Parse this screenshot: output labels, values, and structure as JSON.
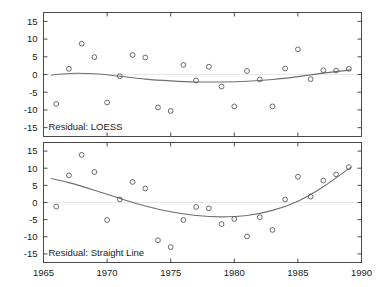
{
  "figure": {
    "background": "#ffffff",
    "axis_color": "#4a4a4a",
    "point_color": "#5a5a5a",
    "line_color": "#6f6f6f",
    "zero_line_color": "#e8e8e8",
    "width": 384,
    "height": 287
  },
  "chart_data": [
    {
      "type": "scatter",
      "panel": "top",
      "title": "",
      "annotation": "Residual: LOESS",
      "xlabel": "",
      "ylabel": "",
      "xlim": [
        1965,
        1990
      ],
      "ylim": [
        -17.5,
        17.5
      ],
      "xticks": [
        1965,
        1970,
        1975,
        1980,
        1985,
        1990
      ],
      "xticklabels": [
        "1965",
        "1970",
        "1975",
        "1980",
        "1985",
        "1990"
      ],
      "yticks": [
        -15,
        -10,
        -5,
        0,
        5,
        10,
        15
      ],
      "yticklabels": [
        "-15",
        "-10",
        "-5",
        "0",
        "5",
        "10",
        "15"
      ],
      "grid": false,
      "legend": "none",
      "zero_reference_line": 0,
      "series": [
        {
          "name": "Residual: LOESS",
          "marker": "open-circle",
          "x": [
            1966,
            1967,
            1968,
            1969,
            1970,
            1971,
            1972,
            1973,
            1974,
            1975,
            1976,
            1977,
            1978,
            1979,
            1980,
            1981,
            1982,
            1983,
            1984,
            1985,
            1986,
            1987,
            1988,
            1989
          ],
          "y": [
            -8.3,
            1.6,
            8.7,
            4.9,
            -7.9,
            -0.5,
            5.5,
            4.8,
            -9.3,
            -10.3,
            2.7,
            -1.7,
            2.2,
            -3.4,
            -9.0,
            1.0,
            -1.4,
            -9.0,
            1.7,
            7.1,
            -1.3,
            1.2,
            1.1,
            1.6
          ]
        },
        {
          "name": "LOESS smooth",
          "type": "line",
          "x": [
            1965.6,
            1967,
            1969,
            1971,
            1973,
            1975,
            1977,
            1979,
            1981,
            1983,
            1985,
            1987,
            1989.2
          ],
          "y": [
            -0.2,
            0.3,
            0.2,
            -0.5,
            -1.3,
            -1.8,
            -2.1,
            -2.1,
            -1.9,
            -1.4,
            -0.6,
            0.4,
            1.3
          ]
        }
      ]
    },
    {
      "type": "scatter",
      "panel": "bottom",
      "title": "",
      "annotation": "Residual: Straight Line",
      "xlabel": "",
      "ylabel": "",
      "xlim": [
        1965,
        1990
      ],
      "ylim": [
        -17.5,
        17.5
      ],
      "xticks": [
        1965,
        1970,
        1975,
        1980,
        1985,
        1990
      ],
      "xticklabels": [
        "1965",
        "1970",
        "1975",
        "1980",
        "1985",
        "1990"
      ],
      "yticks": [
        -15,
        -10,
        -5,
        0,
        5,
        10,
        15
      ],
      "yticklabels": [
        "-15",
        "-10",
        "-5",
        "0",
        "5",
        "10",
        "15"
      ],
      "grid": false,
      "legend": "none",
      "zero_reference_line": 0,
      "series": [
        {
          "name": "Residual: Straight Line",
          "marker": "open-circle",
          "x": [
            1966,
            1967,
            1968,
            1969,
            1970,
            1971,
            1972,
            1973,
            1974,
            1975,
            1976,
            1977,
            1978,
            1979,
            1980,
            1981,
            1982,
            1983,
            1984,
            1985,
            1986,
            1987,
            1988,
            1989
          ],
          "y": [
            -1.2,
            7.9,
            13.9,
            8.9,
            -5.1,
            0.9,
            6.0,
            4.1,
            -11.0,
            -13.0,
            -5.1,
            -1.3,
            -1.7,
            -6.3,
            -4.8,
            -9.9,
            -4.3,
            -8.0,
            0.9,
            7.5,
            1.7,
            6.4,
            8.2,
            10.3
          ]
        },
        {
          "name": "Quadratic fit",
          "type": "line",
          "x": [
            1965.6,
            1967,
            1969,
            1971,
            1973,
            1975,
            1977,
            1979,
            1981,
            1983,
            1985,
            1987,
            1989.2
          ],
          "y": [
            7.0,
            5.8,
            3.6,
            1.2,
            -1.0,
            -2.7,
            -3.8,
            -4.2,
            -3.8,
            -2.3,
            0.4,
            4.6,
            10.4
          ]
        }
      ]
    }
  ]
}
